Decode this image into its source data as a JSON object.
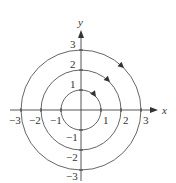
{
  "diagram": {
    "type": "phase-portrait",
    "axes": {
      "x_label": "x",
      "y_label": "y"
    },
    "x_ticks": [
      {
        "value": -3,
        "label": "−3"
      },
      {
        "value": -2,
        "label": "−2"
      },
      {
        "value": -1,
        "label": "−1"
      },
      {
        "value": 1,
        "label": "1"
      },
      {
        "value": 2,
        "label": "2"
      },
      {
        "value": 3,
        "label": "3"
      }
    ],
    "y_ticks": [
      {
        "value": 3,
        "label": "3"
      },
      {
        "value": 2,
        "label": "2"
      },
      {
        "value": 1,
        "label": "1"
      },
      {
        "value": -1,
        "label": "−1"
      },
      {
        "value": -2,
        "label": "−2"
      },
      {
        "value": -3,
        "label": "−3"
      }
    ],
    "circles": [
      {
        "radius": 1,
        "direction": "clockwise"
      },
      {
        "radius": 2,
        "direction": "clockwise"
      },
      {
        "radius": 3,
        "direction": "clockwise"
      }
    ],
    "colors": {
      "stroke": "#555555",
      "text": "#333333",
      "background": "#ffffff"
    }
  }
}
